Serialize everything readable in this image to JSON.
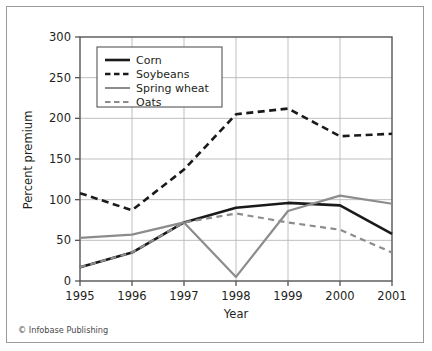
{
  "credit": "© Infobase Publishing",
  "colors": {
    "black": "#1a1a1a",
    "gray": "#8c8c8c",
    "grid": "#b8b8b8",
    "axis": "#555555",
    "frame": "#9a9a9a",
    "text": "#231f20"
  },
  "legend": {
    "items": [
      {
        "label": "Corn",
        "color": "#1a1a1a",
        "dash": "none"
      },
      {
        "label": "Soybeans",
        "color": "#1a1a1a",
        "dash": "dashed"
      },
      {
        "label": "Spring wheat",
        "color": "#8c8c8c",
        "dash": "none"
      },
      {
        "label": "Oats",
        "color": "#8c8c8c",
        "dash": "dashed"
      }
    ]
  },
  "chart_data": {
    "type": "line",
    "title": "",
    "xlabel": "Year",
    "ylabel": "Percent premium",
    "categories": [
      1995,
      1996,
      1997,
      1998,
      1999,
      2000,
      2001
    ],
    "xticklabels": [
      "1995",
      "1996",
      "1997",
      "1998",
      "1999",
      "2000",
      "2001"
    ],
    "yticks": [
      0,
      50,
      100,
      150,
      200,
      250,
      300
    ],
    "yticklabels": [
      "0",
      "50",
      "100",
      "150",
      "200",
      "250",
      "300"
    ],
    "ylim": [
      0,
      300
    ],
    "xlim": [
      1995,
      2001
    ],
    "grid": true,
    "legend_position": "upper-left-inside",
    "series": [
      {
        "name": "Corn",
        "color": "#1a1a1a",
        "dash": "none",
        "width": 2.6,
        "values": [
          17,
          35,
          72,
          90,
          96,
          93,
          58
        ]
      },
      {
        "name": "Soybeans",
        "color": "#1a1a1a",
        "dash": "dashed",
        "width": 2.6,
        "values": [
          108,
          87,
          137,
          205,
          212,
          178,
          181
        ]
      },
      {
        "name": "Spring wheat",
        "color": "#8c8c8c",
        "dash": "none",
        "width": 2.2,
        "values": [
          53,
          57,
          72,
          5,
          86,
          105,
          95
        ]
      },
      {
        "name": "Oats",
        "color": "#8c8c8c",
        "dash": "dashed",
        "width": 2.2,
        "values": [
          17,
          35,
          72,
          83,
          72,
          63,
          35
        ]
      }
    ]
  }
}
